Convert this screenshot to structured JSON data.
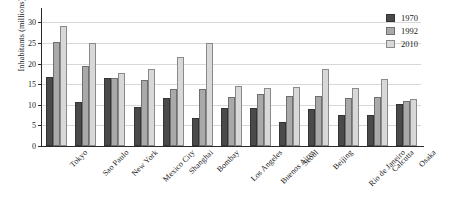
{
  "chart_data": {
    "type": "bar",
    "title": "",
    "xlabel": "",
    "ylabel": "Inhabitants (millions)",
    "ylim": [
      0,
      32
    ],
    "yticks": [
      0,
      5,
      10,
      15,
      20,
      25,
      30
    ],
    "ytick_labels": [
      "0",
      "5",
      "10",
      "15",
      "20",
      "25",
      "30"
    ],
    "grid": true,
    "legend_position": "top-right",
    "categories": [
      "Tokyo",
      "Sao Paulo",
      "New York",
      "Mexico City",
      "Shanghai",
      "Bombay",
      "Los Angeles",
      "Buenos Aires",
      "Seoul",
      "Beijing",
      "Rio de Janeiro",
      "Calcutta",
      "Osaka"
    ],
    "series": [
      {
        "name": "1970",
        "color": "#4a4a4a",
        "values": [
          16.7,
          10.6,
          16.5,
          9.4,
          11.7,
          6.8,
          9.3,
          9.2,
          5.9,
          9.0,
          7.6,
          7.5,
          10.2
        ]
      },
      {
        "name": "1992",
        "color": "#a9a9a9",
        "values": [
          25.2,
          19.5,
          16.5,
          16.0,
          13.8,
          13.8,
          12.0,
          12.5,
          12.1,
          12.1,
          11.7,
          11.8,
          11.0
        ]
      },
      {
        "name": "2010",
        "color": "#d8d8d8",
        "values": [
          29.0,
          25.0,
          17.7,
          18.6,
          21.7,
          25.0,
          14.5,
          14.1,
          14.2,
          18.6,
          14.1,
          16.2,
          11.3
        ]
      }
    ]
  }
}
